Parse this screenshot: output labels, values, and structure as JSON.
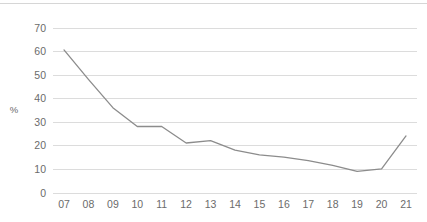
{
  "chart_data": {
    "type": "line",
    "title": "",
    "subtitle": "",
    "xlabel": "",
    "ylabel": "%",
    "categories": [
      "07",
      "08",
      "09",
      "10",
      "11",
      "12",
      "13",
      "14",
      "15",
      "16",
      "17",
      "18",
      "19",
      "20",
      "21"
    ],
    "values": [
      60.5,
      48,
      36,
      28,
      28,
      21,
      22,
      18,
      16,
      15,
      13.5,
      11.5,
      9,
      10,
      24
    ],
    "series": [
      {
        "name": "",
        "values": [
          60.5,
          48,
          36,
          28,
          28,
          21,
          22,
          18,
          16,
          15,
          13.5,
          11.5,
          9,
          10,
          24
        ]
      }
    ],
    "ylim": [
      0,
      70
    ],
    "yticks": [
      0,
      10,
      20,
      30,
      40,
      50,
      60,
      70
    ],
    "ytick_labels": [
      "0",
      "10",
      "20",
      "30",
      "40",
      "50",
      "60",
      "70"
    ],
    "grid": "horizontal",
    "legend": "none",
    "line_color": "#8c8c8c",
    "grid_color": "#dcdcdc",
    "text_color": "#6b6b6b",
    "background": "#ffffff"
  }
}
